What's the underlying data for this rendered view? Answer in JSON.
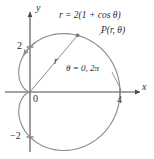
{
  "figure": {
    "kind": "polar-cardioid-plot",
    "equation_label": "r = 2(1 + cos θ)",
    "point_label": "P(r, θ)",
    "radius_label": "r",
    "theta_label": "θ = 0, 2π",
    "origin_label": "0",
    "x_axis_label": "x",
    "y_axis_label": "y",
    "tick_x_4": "4",
    "tick_y_2": "2",
    "tick_y_neg2": "−2",
    "curve_color": "#8e8e8e",
    "axis_color": "#4a4a4a",
    "text_color": "#2b2b2b"
  },
  "chart_data": {
    "type": "line",
    "plot_style": "polar",
    "title": "",
    "subtitle": "",
    "xlabel": "x",
    "ylabel": "y",
    "equation": "r = 2(1 + cos θ)",
    "polar_a": 2,
    "grid": false,
    "legend": "none",
    "xlim": [
      -1.4,
      5.0
    ],
    "ylim": [
      -3.4,
      3.6
    ],
    "xticks": [
      4
    ],
    "xticklabels": [
      "4"
    ],
    "yticks": [
      2,
      -2
    ],
    "yticklabels": [
      "2",
      "−2"
    ],
    "annotations": [
      {
        "text": "r = 2(1 + cos θ)",
        "role": "curve-equation"
      },
      {
        "text": "P(r, θ)",
        "role": "point-label"
      },
      {
        "text": "r",
        "role": "radial-segment-label"
      },
      {
        "text": "θ = 0, 2π",
        "role": "angle-label",
        "points_to_x": 4,
        "points_to_y": 0
      },
      {
        "text": "0",
        "role": "origin-label"
      }
    ],
    "marked_points": [
      {
        "name": "P",
        "theta_deg": 50,
        "r": 3.2857,
        "x": 2.112,
        "y": 2.517
      },
      {
        "name": "cusp",
        "theta_deg": 180,
        "r": 0,
        "x": 0,
        "y": 0
      },
      {
        "name": "vertex",
        "theta_deg": 0,
        "r": 4,
        "x": 4,
        "y": 0
      }
    ],
    "direction_arrow": {
      "at_theta_deg": 100,
      "direction": "increasing-theta"
    },
    "theta_range_deg": [
      0,
      360
    ],
    "series": [
      {
        "name": "r = 2(1 + cos θ)",
        "theta_deg": [
          0,
          10,
          20,
          30,
          40,
          50,
          60,
          70,
          80,
          90,
          100,
          110,
          120,
          130,
          140,
          150,
          160,
          170,
          180,
          190,
          200,
          210,
          220,
          230,
          240,
          250,
          260,
          270,
          280,
          290,
          300,
          310,
          320,
          330,
          340,
          350,
          360
        ],
        "r": [
          4.0,
          3.97,
          3.879,
          3.732,
          3.532,
          3.286,
          3.0,
          2.684,
          2.347,
          2.0,
          1.653,
          1.316,
          1.0,
          0.714,
          0.468,
          0.268,
          0.121,
          0.03,
          0.0,
          0.03,
          0.121,
          0.268,
          0.468,
          0.714,
          1.0,
          1.316,
          1.653,
          2.0,
          2.347,
          2.684,
          3.0,
          3.286,
          3.532,
          3.732,
          3.879,
          3.97,
          4.0
        ]
      }
    ]
  }
}
